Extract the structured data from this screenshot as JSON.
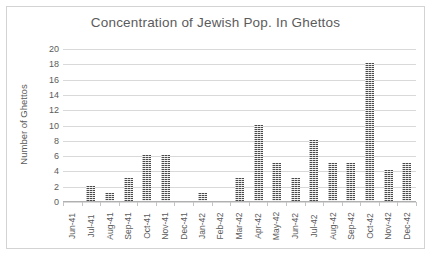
{
  "chart_data": {
    "type": "bar",
    "title": "Concentration of Jewish Pop. In Ghettos",
    "xlabel": "",
    "ylabel": "Number of Ghettos",
    "ylim": [
      0,
      20
    ],
    "ytick_step": 2,
    "ytick_labels": [
      "20",
      "18",
      "16",
      "14",
      "12",
      "10",
      "8",
      "6",
      "4",
      "2",
      "0"
    ],
    "grid": true,
    "legend": "none",
    "bar_color": "#4a4a4a",
    "bar_pattern": "dotted-texture",
    "text_color": "#5b5b5b",
    "gridline_color": "#d9d9d9",
    "border_color": "#d3d3d3",
    "categories": [
      "Jun-41",
      "Jul-41",
      "Aug-41",
      "Sep-41",
      "Oct-41",
      "Nov-41",
      "Dec-41",
      "Jan-42",
      "Feb-42",
      "Mar-42",
      "Apr-42",
      "May-42",
      "Jun-42",
      "Jul-42",
      "Aug-42",
      "Sep-42",
      "Oct-42",
      "Nov-42",
      "Dec-42"
    ],
    "values": [
      0,
      2,
      1,
      3,
      6,
      6,
      0,
      1,
      0,
      3,
      10,
      5,
      3,
      8,
      5,
      5,
      18,
      4,
      5
    ]
  }
}
